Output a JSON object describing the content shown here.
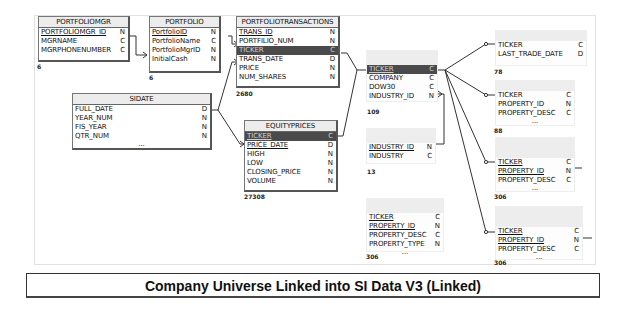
{
  "diagram": {
    "caption": "Company Universe Linked into SI Data V3 (Linked)",
    "tables": {
      "portfoliomgr": {
        "title": "PORTFOLIOMGR",
        "count": "6",
        "fields": [
          {
            "name": "PORTFOLIOMGR_ID",
            "type": "N",
            "key": true
          },
          {
            "name": "MGRNAME",
            "type": "C"
          },
          {
            "name": "MGRPHONENUMBER",
            "type": "C"
          }
        ]
      },
      "portfolio": {
        "title": "PORTFOLIO",
        "count": "6",
        "fields": [
          {
            "name": "PortfolioID",
            "type": "N",
            "key": true
          },
          {
            "name": "PortfolioName",
            "type": "C"
          },
          {
            "name": "PortfolioMgrID",
            "type": "N"
          },
          {
            "name": "InitialCash",
            "type": "N"
          }
        ]
      },
      "portfoliotransactions": {
        "title": "PORTFOLIOTRANSACTIONS",
        "count": "2680",
        "fields": [
          {
            "name": "TRANS_ID",
            "type": "N",
            "key": true
          },
          {
            "name": "PORTFILIO_NUM",
            "type": "N"
          },
          {
            "name": "TICKER",
            "type": "C",
            "selected": true
          },
          {
            "name": "TRANS_DATE",
            "type": "D"
          },
          {
            "name": "PRICE",
            "type": "N"
          },
          {
            "name": "NUM_SHARES",
            "type": "N"
          }
        ]
      },
      "sidate": {
        "title": "SIDATE",
        "ellipsis": "...",
        "fields": [
          {
            "name": "FULL_DATE",
            "type": "D"
          },
          {
            "name": "YEAR_NUM",
            "type": "N"
          },
          {
            "name": "FIS_YEAR",
            "type": "N"
          },
          {
            "name": "QTR_NUM",
            "type": "N"
          }
        ]
      },
      "equityprices": {
        "title": "EQUITYPRICES",
        "count": "27308",
        "fields": [
          {
            "name": "TICKER",
            "type": "C",
            "key": true,
            "selected": true
          },
          {
            "name": "PRICE_DATE",
            "type": "D",
            "key": true
          },
          {
            "name": "HIGH",
            "type": "N"
          },
          {
            "name": "LOW",
            "type": "N"
          },
          {
            "name": "CLOSING_PRICE",
            "type": "N"
          },
          {
            "name": "VOLUME",
            "type": "N"
          }
        ]
      },
      "company": {
        "count": "109",
        "fields": [
          {
            "name": "TICKER",
            "type": "C",
            "selected": true
          },
          {
            "name": "COMPANY",
            "type": "C"
          },
          {
            "name": "DOW30",
            "type": "C"
          },
          {
            "name": "INDUSTRY_ID",
            "type": "N"
          }
        ]
      },
      "industry": {
        "count": "13",
        "fields": [
          {
            "name": "INDUSTRY_ID",
            "type": "N",
            "key": true
          },
          {
            "name": "INDUSTRY",
            "type": "C"
          }
        ]
      },
      "company_property": {
        "count": "306",
        "ellipsis": "...",
        "fields": [
          {
            "name": "TICKER",
            "type": "C",
            "key": true
          },
          {
            "name": "PROPERTY_ID",
            "type": "N",
            "key": true
          },
          {
            "name": "PROPERTY_DESC",
            "type": "C"
          },
          {
            "name": "PROPERTY_TYPE",
            "type": "N"
          }
        ]
      },
      "linked_trade_date": {
        "count": "78",
        "fields": [
          {
            "name": "TICKER",
            "type": "C"
          },
          {
            "name": "LAST_TRADE_DATE",
            "type": "D"
          }
        ]
      },
      "linked_property_a": {
        "count": "88",
        "ellipsis": "...",
        "fields": [
          {
            "name": "TICKER",
            "type": "C"
          },
          {
            "name": "PROPERTY_ID",
            "type": "N"
          },
          {
            "name": "PROPERTY_DESC",
            "type": "C"
          }
        ]
      },
      "linked_property_b": {
        "count": "306",
        "ellipsis": "...",
        "fields": [
          {
            "name": "TICKER",
            "type": "C",
            "key": true
          },
          {
            "name": "PROPERTY_ID",
            "type": "N",
            "key": true
          },
          {
            "name": "PROPERTY_DESC",
            "type": "C"
          }
        ]
      },
      "linked_property_c": {
        "count": "306",
        "ellipsis": "...",
        "fields": [
          {
            "name": "TICKER",
            "type": "C",
            "key": true
          },
          {
            "name": "PROPERTY_ID",
            "type": "N",
            "key": true
          },
          {
            "name": "PROPERTY_DESC",
            "type": "C"
          }
        ]
      }
    },
    "colors": {
      "line": "#333333",
      "selected_row": "#4a4a4a",
      "header_bg": "#ececec"
    }
  }
}
